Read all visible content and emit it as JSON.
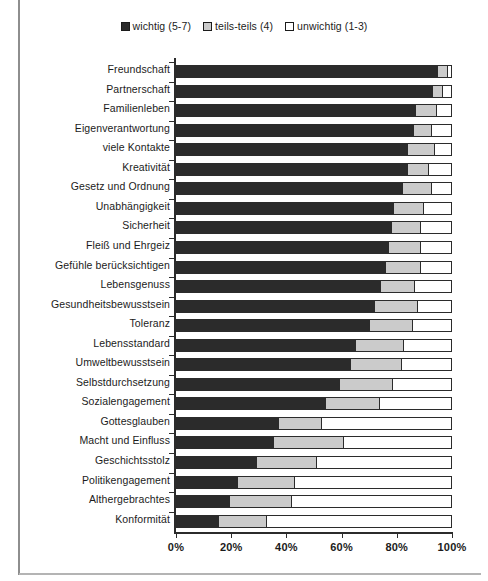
{
  "chart_data": {
    "type": "bar",
    "orientation": "horizontal",
    "stacked": true,
    "stacked_normalized": true,
    "title": "",
    "xlabel": "",
    "ylabel": "",
    "xlim": [
      0,
      100
    ],
    "grid": false,
    "legend_position": "top-center",
    "xticks": [
      {
        "value": 0,
        "label": "0%"
      },
      {
        "value": 20,
        "label": "20%"
      },
      {
        "value": 40,
        "label": "40%"
      },
      {
        "value": 60,
        "label": "60%"
      },
      {
        "value": 80,
        "label": "80%"
      },
      {
        "value": 100,
        "label": "100%"
      }
    ],
    "legend": [
      {
        "label": "wichtig (5-7)",
        "color": "#2b2b2b"
      },
      {
        "label": "teils-teils (4)",
        "color": "#cbcbcb"
      },
      {
        "label": "unwichtig (1-3)",
        "color": "#ffffff"
      }
    ],
    "categories": [
      "Freundschaft",
      "Partnerschaft",
      "Familienleben",
      "Eigenverantwortung",
      "viele Kontakte",
      "Kreativität",
      "Gesetz und Ordnung",
      "Unabhängigkeit",
      "Sicherheit",
      "Fleiß und Ehrgeiz",
      "Gefühle berücksichtigen",
      "Lebensgenuss",
      "Gesundheitsbewusstsein",
      "Toleranz",
      "Lebensstandard",
      "Umweltbewusstsein",
      "Selbstdurchsetzung",
      "Sozialengagement",
      "Gottesglauben",
      "Macht und Einfluss",
      "Geschichtsstolz",
      "Politikengagement",
      "Althergebrachtes",
      "Konformität"
    ],
    "series": [
      {
        "name": "wichtig (5-7)",
        "color": "#2b2b2b",
        "values": [
          95,
          93,
          87,
          86,
          84,
          84,
          82,
          79,
          78,
          77,
          76,
          74,
          72,
          70,
          65,
          63,
          59,
          54,
          37,
          35,
          29,
          22,
          19,
          15
        ]
      },
      {
        "name": "teils-teils (4)",
        "color": "#cbcbcb",
        "values": [
          4,
          4,
          8,
          7,
          10,
          8,
          11,
          11,
          11,
          12,
          13,
          13,
          16,
          16,
          18,
          19,
          20,
          20,
          16,
          26,
          22,
          21,
          23,
          18
        ]
      },
      {
        "name": "unwichtig (1-3)",
        "color": "#ffffff",
        "values": [
          1,
          3,
          5,
          7,
          6,
          8,
          7,
          10,
          11,
          11,
          11,
          13,
          12,
          14,
          17,
          18,
          21,
          26,
          47,
          39,
          49,
          57,
          58,
          67
        ]
      }
    ]
  }
}
